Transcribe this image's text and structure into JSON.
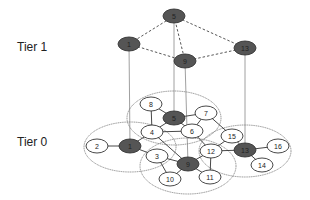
{
  "tiers": {
    "tier1": {
      "label": "Tier 1"
    },
    "tier0": {
      "label": "Tier 0"
    }
  },
  "colors": {
    "cluster_head_fill": "#555555",
    "node_fill": "#ffffff",
    "stroke": "#333333",
    "cluster_boundary": "#777777",
    "link": "#888888"
  },
  "tier1_nodes": [
    {
      "id": "5",
      "x": 174,
      "y": 16
    },
    {
      "id": "1",
      "x": 129,
      "y": 44
    },
    {
      "id": "9",
      "x": 185,
      "y": 61
    },
    {
      "id": "13",
      "x": 245,
      "y": 48
    }
  ],
  "tier1_edges": [
    [
      "5",
      "1"
    ],
    [
      "5",
      "9"
    ],
    [
      "5",
      "13"
    ],
    [
      "1",
      "9"
    ],
    [
      "9",
      "13"
    ]
  ],
  "clusters": [
    {
      "head": "5",
      "cx": 174,
      "cy": 118,
      "rx": 47,
      "ry": 27
    },
    {
      "head": "1",
      "cx": 130,
      "cy": 147,
      "rx": 46,
      "ry": 25
    },
    {
      "head": "9",
      "cx": 188,
      "cy": 166,
      "rx": 48,
      "ry": 28
    },
    {
      "head": "13",
      "cx": 245,
      "cy": 151,
      "rx": 46,
      "ry": 26
    }
  ],
  "tier0_nodes": [
    {
      "id": "8",
      "x": 151,
      "y": 104,
      "head": false
    },
    {
      "id": "5",
      "x": 174,
      "y": 118,
      "head": true
    },
    {
      "id": "7",
      "x": 206,
      "y": 113,
      "head": false
    },
    {
      "id": "4",
      "x": 152,
      "y": 132,
      "head": false
    },
    {
      "id": "6",
      "x": 192,
      "y": 131,
      "head": false
    },
    {
      "id": "2",
      "x": 97,
      "y": 146,
      "head": false
    },
    {
      "id": "1",
      "x": 130,
      "y": 146,
      "head": true
    },
    {
      "id": "3",
      "x": 157,
      "y": 156,
      "head": false
    },
    {
      "id": "15",
      "x": 232,
      "y": 136,
      "head": false
    },
    {
      "id": "12",
      "x": 211,
      "y": 151,
      "head": false
    },
    {
      "id": "13",
      "x": 245,
      "y": 150,
      "head": true
    },
    {
      "id": "16",
      "x": 278,
      "y": 146,
      "head": false
    },
    {
      "id": "14",
      "x": 262,
      "y": 165,
      "head": false
    },
    {
      "id": "9",
      "x": 188,
      "y": 164,
      "head": true
    },
    {
      "id": "10",
      "x": 170,
      "y": 179,
      "head": false
    },
    {
      "id": "11",
      "x": 210,
      "y": 177,
      "head": false
    }
  ],
  "tier0_edges": [
    [
      "8",
      "5"
    ],
    [
      "8",
      "4"
    ],
    [
      "5",
      "7"
    ],
    [
      "5",
      "6"
    ],
    [
      "5",
      "4"
    ],
    [
      "7",
      "6"
    ],
    [
      "7",
      "15"
    ],
    [
      "4",
      "1"
    ],
    [
      "4",
      "6"
    ],
    [
      "4",
      "9"
    ],
    [
      "2",
      "1"
    ],
    [
      "1",
      "3"
    ],
    [
      "3",
      "10"
    ],
    [
      "3",
      "9"
    ],
    [
      "6",
      "12"
    ],
    [
      "9",
      "10"
    ],
    [
      "9",
      "11"
    ],
    [
      "9",
      "12"
    ],
    [
      "12",
      "11"
    ],
    [
      "12",
      "15"
    ],
    [
      "12",
      "13"
    ],
    [
      "15",
      "13"
    ],
    [
      "13",
      "16"
    ],
    [
      "13",
      "14"
    ]
  ],
  "vertical_links": [
    "5",
    "1",
    "9",
    "13"
  ]
}
